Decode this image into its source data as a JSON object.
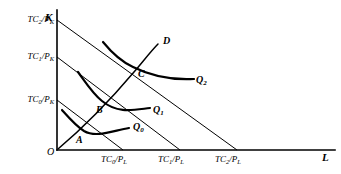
{
  "figure": {
    "type": "economics-isoquant-isocost-diagram",
    "background": "#ffffff",
    "ink": "#000000",
    "width": 341,
    "height": 174
  },
  "axes": {
    "vertical": {
      "name": "K",
      "x": 57,
      "top": 10,
      "bottom": 150
    },
    "horizontal": {
      "name": "L",
      "y": 150,
      "left": 57,
      "right": 335
    },
    "origin_label": "O"
  },
  "y_ticks": [
    {
      "label_html": "TC<sub>0</sub>/P<sub>K</sub>",
      "text": "TC0/PK",
      "y": 100
    },
    {
      "label_html": "TC<sub>1</sub>/P<sub>K</sub>",
      "text": "TC1/PK",
      "y": 57
    },
    {
      "label_html": "TC<sub>2</sub>/P<sub>K</sub>",
      "text": "TC2/PK",
      "y": 20
    }
  ],
  "x_ticks": [
    {
      "label_html": "TC<sub>0</sub>/P<sub>L</sub>",
      "text": "TC0/PL",
      "x": 123
    },
    {
      "label_html": "TC<sub>1</sub>/P<sub>L</sub>",
      "text": "TC1/PL",
      "x": 180
    },
    {
      "label_html": "TC<sub>2</sub>/P<sub>L</sub>",
      "text": "TC2/PL",
      "x": 237
    }
  ],
  "isocost_lines": [
    {
      "name": "isocost-0",
      "k_intercept_y": 100,
      "l_intercept_x": 123
    },
    {
      "name": "isocost-1",
      "k_intercept_y": 57,
      "l_intercept_x": 180
    },
    {
      "name": "isocost-2",
      "k_intercept_y": 20,
      "l_intercept_x": 237
    }
  ],
  "isoquants": [
    {
      "label_html": "Q<sub>0</sub>",
      "text": "Q0",
      "label_x": 133,
      "label_y": 122,
      "path": "M 62,110 C 70,119 76,126 84,131 C 96,138 112,131 129,128"
    },
    {
      "label_html": "Q<sub>1</sub>",
      "text": "Q1",
      "label_x": 153,
      "label_y": 105,
      "path": "M 78,72 C 86,83 93,94 102,101 C 118,114 133,110 150,108"
    },
    {
      "label_html": "Q<sub>2</sub>",
      "text": "Q2",
      "label_x": 196,
      "label_y": 75,
      "path": "M 103,42 C 112,53 122,62 133,67 C 155,78 175,80 194,79"
    }
  ],
  "expansion_path": {
    "label": "D",
    "label_x": 163,
    "label_y": 36,
    "path": "M 58,149 C 84,127 112,98 134,72 C 145,59 152,50 158,44"
  },
  "tangency_points": [
    {
      "label": "A",
      "x": 84,
      "y": 131,
      "label_x": 76,
      "label_y": 135
    },
    {
      "label": "B",
      "x": 102,
      "y": 101,
      "label_x": 96,
      "label_y": 105
    },
    {
      "label": "C",
      "x": 133,
      "y": 67,
      "label_x": 138,
      "label_y": 69
    }
  ]
}
